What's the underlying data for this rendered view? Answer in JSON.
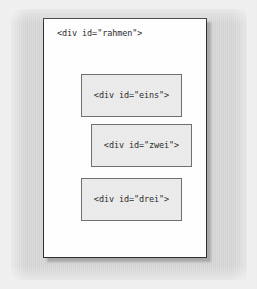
{
  "figure": {
    "name": "nested-div-diagram",
    "outer_background_color": "#f1f1f1",
    "mat_color": "#d6d6d6",
    "page": {
      "background_color": "#ffffff",
      "border_color": "#2e2e2e",
      "label": "<div id=\"rahmen\">"
    },
    "boxes": [
      {
        "id": "eins",
        "label": "<div id=\"eins\">",
        "fill_color": "#ececec",
        "border_color": "#6f6f6f"
      },
      {
        "id": "zwei",
        "label": "<div id=\"zwei\">",
        "fill_color": "#ececec",
        "border_color": "#6f6f6f"
      },
      {
        "id": "drei",
        "label": "<div id=\"drei\">",
        "fill_color": "#ececec",
        "border_color": "#6f6f6f"
      }
    ],
    "text_color": "#2b2b2b"
  }
}
